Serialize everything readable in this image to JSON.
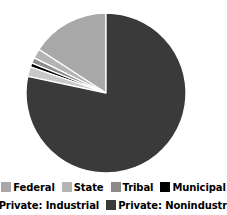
{
  "chart_data": {
    "type": "pie",
    "title": "",
    "subtitle": "",
    "xlabel": "",
    "ylabel": "",
    "grid": false,
    "legend_position": "bottom",
    "start_angle_deg": 0,
    "direction": "clockwise",
    "categories": [
      "Federal",
      "State",
      "Tribal",
      "Municipal",
      "Private: Industrial",
      "Private: Nonindustrial"
    ],
    "values": [
      19.0,
      2.0,
      1.2,
      0.8,
      2.0,
      75.0
    ],
    "slices": [
      {
        "label": "Federal",
        "value": 19.0,
        "color": "#a8a8a8",
        "start_deg": 303.0,
        "end_deg": 360.0
      },
      {
        "label": "State",
        "value": 2.0,
        "color": "#b4b4b4",
        "start_deg": 296.0,
        "end_deg": 303.0
      },
      {
        "label": "Tribal",
        "value": 1.2,
        "color": "#8c8c8c",
        "start_deg": 292.0,
        "end_deg": 296.0
      },
      {
        "label": "Municipal",
        "value": 0.8,
        "color": "#000000",
        "start_deg": 289.0,
        "end_deg": 292.0
      },
      {
        "label": "Private: Industrial",
        "value": 2.0,
        "color": "#c8c8c8",
        "start_deg": 282.0,
        "end_deg": 289.0
      },
      {
        "label": "Private: Nonindustrial",
        "value": 75.0,
        "color": "#3a3a3a",
        "start_deg": 0.0,
        "end_deg": 282.0
      }
    ],
    "geometry": {
      "center_x": 106,
      "center_y": 93,
      "radius": 80
    },
    "colors": {
      "federal": "#a8a8a8",
      "state": "#b4b4b4",
      "tribal": "#8c8c8c",
      "municipal": "#000000",
      "private_industrial": "#c8c8c8",
      "private_nonindustrial": "#3a3a3a",
      "separator": "#ffffff",
      "background": "#ffffff",
      "text": "#000000"
    }
  },
  "legend": {
    "rows": [
      [
        {
          "label": "Federal",
          "color": "#a8a8a8"
        },
        {
          "label": "State",
          "color": "#b4b4b4"
        },
        {
          "label": "Tribal",
          "color": "#8c8c8c"
        },
        {
          "label": "Municipal",
          "color": "#000000"
        }
      ],
      [
        {
          "label": "Private: Industrial",
          "color": "#c8c8c8"
        },
        {
          "label": "Private: Nonindustrial",
          "color": "#3a3a3a"
        }
      ]
    ]
  }
}
